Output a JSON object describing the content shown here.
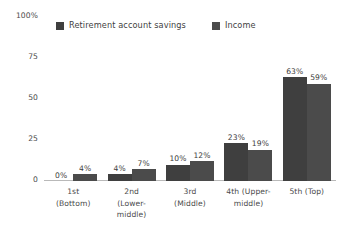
{
  "chart_data": {
    "type": "bar",
    "title": "",
    "subtitle": "",
    "xlabel": "",
    "ylabel": "",
    "ylim": [
      0,
      100
    ],
    "yticks": [
      "0",
      "25",
      "50",
      "75",
      "100%"
    ],
    "grid": false,
    "legend_position": "top",
    "categories": [
      "1st (Bottom)",
      "2nd (Lower-middle)",
      "3rd (Middle)",
      "4th (Upper-middle)",
      "5th (Top)"
    ],
    "category_lines": [
      [
        "1st",
        "(Bottom)"
      ],
      [
        "2nd",
        "(Lower-",
        "middle)"
      ],
      [
        "3rd",
        "(Middle)"
      ],
      [
        "4th (Upper-",
        "middle)"
      ],
      [
        "5th (Top)"
      ]
    ],
    "series": [
      {
        "name": "Retirement account savings",
        "color": "#3f3f3f",
        "values": [
          0,
          4,
          10,
          23,
          63
        ],
        "labels": [
          "0%",
          "4%",
          "10%",
          "23%",
          "63%"
        ]
      },
      {
        "name": "Income",
        "color": "#4b4b4b",
        "values": [
          4,
          7,
          12,
          19,
          59
        ],
        "labels": [
          "4%",
          "7%",
          "12%",
          "19%",
          "59%"
        ]
      }
    ]
  },
  "axis": {
    "y_ticks": [
      {
        "label": "100%",
        "value": 100
      },
      {
        "label": "75",
        "value": 75
      },
      {
        "label": "50",
        "value": 50
      },
      {
        "label": "25",
        "value": 25
      },
      {
        "label": "0",
        "value": 0
      }
    ],
    "baseline_color": "#b9b9b9"
  },
  "legend": {
    "items": [
      {
        "label": "Retirement account savings",
        "color": "#3f3f3f"
      },
      {
        "label": "Income",
        "color": "#4b4b4b"
      }
    ]
  },
  "colors": {
    "background": "#ffffff",
    "text": "#3a3a3a",
    "series_1": "#3f3f3f",
    "series_2": "#4b4b4b",
    "axis_line": "#b9b9b9"
  }
}
